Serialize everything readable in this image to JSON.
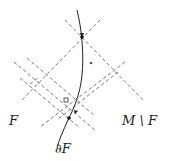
{
  "labels": {
    "left_region": "F",
    "right_region": "M \\ F",
    "boundary": "∂F"
  },
  "colors": {
    "line": "#555555",
    "curve": "#222222",
    "background": "#ffffff"
  },
  "points": {
    "top_dot": [
      82,
      37
    ],
    "small_circle": [
      91,
      63
    ],
    "cross_marker": [
      66,
      100
    ],
    "lower_dot": [
      69,
      118
    ]
  }
}
